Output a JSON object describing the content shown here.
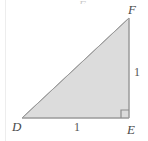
{
  "figure": {
    "kind": "geometry-diagram",
    "canvas": {
      "width": 148,
      "height": 141,
      "background": "#ffffff"
    },
    "style": {
      "fill": "#dcdcdc",
      "stroke": "#9a9a9a",
      "stroke_width": 1,
      "label_color": "#4a4a4a",
      "measure_color": "#555555",
      "rule_color": "#ededed"
    },
    "vertices": [
      {
        "name": "D",
        "label": "D",
        "x": 22,
        "y": 118,
        "label_x": 12,
        "label_y": 120
      },
      {
        "name": "E",
        "label": "E",
        "x": 129,
        "y": 118,
        "label_x": 127,
        "label_y": 123
      },
      {
        "name": "F",
        "label": "F",
        "x": 129,
        "y": 18,
        "label_x": 128,
        "label_y": 3
      }
    ],
    "sides": [
      {
        "name": "DE",
        "measure": "1",
        "label_x": 74,
        "label_y": 121,
        "role": "base"
      },
      {
        "name": "EF",
        "measure": "1",
        "label_x": 134,
        "label_y": 66,
        "role": "vertical-leg"
      },
      {
        "name": "DF",
        "measure": "",
        "role": "hypotenuse"
      }
    ],
    "right_angle": {
      "at_vertex": "E",
      "marker_size": 8,
      "marker_x": 121,
      "marker_y": 110
    },
    "artifacts": {
      "top_clipped_glyph": "F",
      "left_rule": true
    }
  }
}
